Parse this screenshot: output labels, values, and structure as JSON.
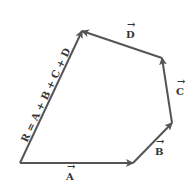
{
  "diagram": {
    "vectors": [
      {
        "name": "A",
        "label": "A",
        "from": [
          20,
          163
        ],
        "to": [
          133,
          163
        ]
      },
      {
        "name": "B",
        "label": "B",
        "from": [
          133,
          163
        ],
        "to": [
          172,
          123
        ]
      },
      {
        "name": "C",
        "label": "C",
        "from": [
          172,
          123
        ],
        "to": [
          162,
          58
        ]
      },
      {
        "name": "D",
        "label": "D",
        "from": [
          162,
          58
        ],
        "to": [
          82,
          31
        ]
      },
      {
        "name": "R",
        "label": "R = A + B + C + D",
        "from": [
          20,
          163
        ],
        "to": [
          82,
          31
        ]
      }
    ],
    "labels": {
      "A": "A",
      "B": "B",
      "C": "C",
      "D": "D",
      "R": "R = A + B + C + D"
    },
    "color": "#555555"
  }
}
